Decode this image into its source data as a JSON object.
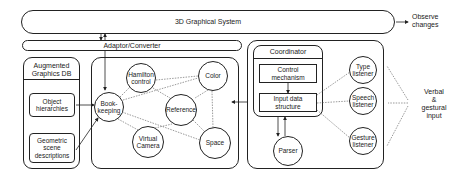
{
  "diagram": {
    "top_system": "3D Graphical System",
    "adaptor": "Adaptor/Converter",
    "observe": "Observe\nchanges",
    "external_input": "Verbal\n&\ngestural\ninput",
    "db": {
      "title": "Augmented\nGraphics DB",
      "items": [
        "Object\nhierarchies",
        "Geometric\nscene\ndescriptions"
      ]
    },
    "agents": {
      "bookkeeping": "Book-\nkeeping",
      "hamilton": "Hamilton\ncontrol",
      "color": "Color",
      "reference": "Reference",
      "virtual_camera": "Virtual\nCamera",
      "space": "Space"
    },
    "coordinator": {
      "title": "Coordinator",
      "control": "Control\nmechanism",
      "input": "Input data\nstructure",
      "parser": "Parser"
    },
    "listeners": {
      "type": "Type\nlistener",
      "speech": "Speech\nlistener",
      "gesture": "Gesture\nlistener"
    }
  }
}
